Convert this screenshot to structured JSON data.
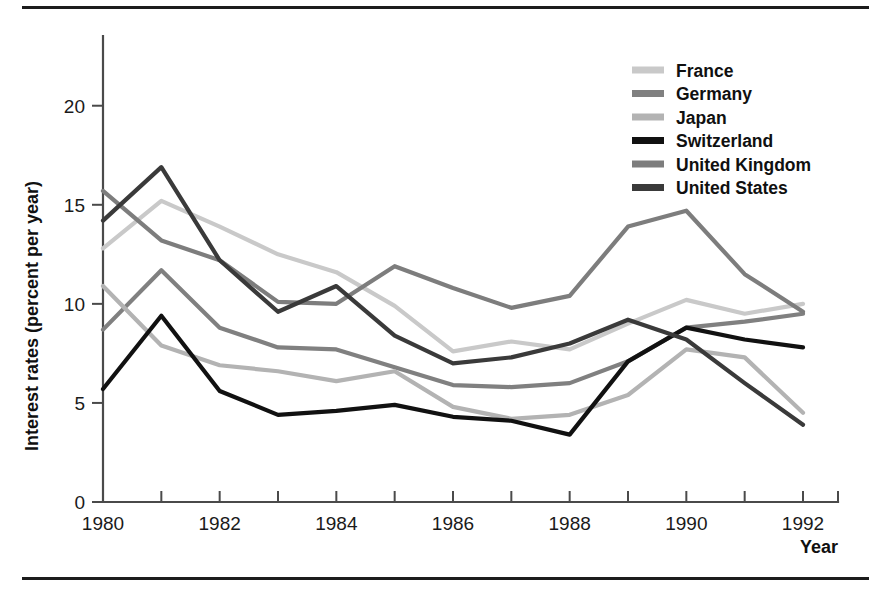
{
  "figure": {
    "has_top_rule": true,
    "has_bottom_rule": true,
    "background": "#ffffff"
  },
  "chart_data": {
    "type": "line",
    "title": "",
    "xlabel": "Year",
    "ylabel": "Interest rates (percent per year)",
    "x": [
      1980,
      1981,
      1982,
      1983,
      1984,
      1985,
      1986,
      1987,
      1988,
      1989,
      1990,
      1991,
      1992
    ],
    "xlim": [
      1980,
      1992.6
    ],
    "ylim": [
      0,
      21.5
    ],
    "yticks": [
      0,
      5,
      10,
      15,
      20
    ],
    "yticklabels": [
      "0",
      "5",
      "10",
      "15",
      "20"
    ],
    "xticks": [
      1980,
      1981,
      1982,
      1983,
      1984,
      1985,
      1986,
      1987,
      1988,
      1989,
      1990,
      1991,
      1992
    ],
    "xticklabels_shown": [
      "1980",
      "1982",
      "1984",
      "1986",
      "1988",
      "1990",
      "1992"
    ],
    "xticklabels_shown_values": [
      1980,
      1982,
      1984,
      1986,
      1988,
      1990,
      1992
    ],
    "grid": false,
    "legend_position": "top-right",
    "series": [
      {
        "name": "France",
        "color": "#c9c9c9",
        "values": [
          12.8,
          15.2,
          13.9,
          12.5,
          11.6,
          9.9,
          7.6,
          8.1,
          7.7,
          9.0,
          10.2,
          9.5,
          10.0
        ]
      },
      {
        "name": "Germany",
        "color": "#808080",
        "values": [
          8.7,
          11.7,
          8.8,
          7.8,
          7.7,
          6.8,
          5.9,
          5.8,
          6.0,
          7.1,
          8.8,
          9.1,
          9.5
        ]
      },
      {
        "name": "Japan",
        "color": "#b3b3b3",
        "values": [
          10.9,
          7.9,
          6.9,
          6.6,
          6.1,
          6.6,
          4.8,
          4.2,
          4.4,
          5.4,
          7.7,
          7.3,
          4.5
        ]
      },
      {
        "name": "Switzerland",
        "color": "#111111",
        "values": [
          5.7,
          9.4,
          5.6,
          4.4,
          4.6,
          4.9,
          4.3,
          4.1,
          3.4,
          7.1,
          8.8,
          8.2,
          7.8
        ]
      },
      {
        "name": "United Kingdom",
        "color": "#7d7d7d",
        "values": [
          15.7,
          13.2,
          12.2,
          10.1,
          10.0,
          11.9,
          10.8,
          9.8,
          10.4,
          13.9,
          14.7,
          11.5,
          9.6
        ]
      },
      {
        "name": "United States",
        "color": "#3a3a3a",
        "values": [
          14.2,
          16.9,
          12.2,
          9.6,
          10.9,
          8.4,
          7.0,
          7.3,
          8.0,
          9.2,
          8.2,
          6.0,
          3.9
        ]
      }
    ]
  },
  "legend": {
    "items": [
      {
        "label": "France",
        "color": "#c9c9c9"
      },
      {
        "label": "Germany",
        "color": "#808080"
      },
      {
        "label": "Japan",
        "color": "#b3b3b3"
      },
      {
        "label": "Switzerland",
        "color": "#111111"
      },
      {
        "label": "United Kingdom",
        "color": "#7d7d7d"
      },
      {
        "label": "United States",
        "color": "#3a3a3a"
      }
    ]
  },
  "axes": {
    "y_title": "Interest rates (percent per year)",
    "x_title": "Year",
    "y_tick_labels": [
      "20",
      "15",
      "10",
      "5",
      "0"
    ],
    "x_tick_labels": [
      "1980",
      "1982",
      "1984",
      "1986",
      "1988",
      "1990",
      "1992"
    ]
  }
}
